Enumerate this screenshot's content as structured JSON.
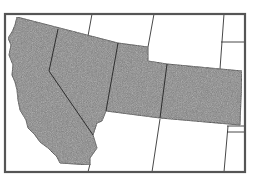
{
  "map": {
    "type": "regional outline map",
    "region": "Western United States",
    "highlighted_states": [
      "California",
      "Nevada",
      "Utah",
      "Colorado"
    ],
    "unhighlighted_states_visible": [
      "Oregon",
      "Idaho",
      "Wyoming",
      "Nebraska",
      "Arizona",
      "New Mexico",
      "Kansas",
      "Oklahoma"
    ],
    "colors": {
      "highlight_fill": "#7a7a7a",
      "border": "#333333",
      "frame": "#555555",
      "background": "#ffffff"
    }
  }
}
